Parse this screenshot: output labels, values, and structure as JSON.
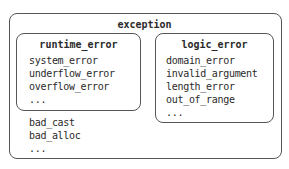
{
  "diagram": {
    "root": {
      "label": "exception",
      "children": [
        {
          "label": "runtime_error",
          "items": [
            "system_error",
            "underflow_error",
            "overflow_error",
            "..."
          ]
        },
        {
          "label": "logic_error",
          "items": [
            "domain_error",
            "invalid_argument",
            "length_error",
            "out_of_range",
            "..."
          ]
        }
      ],
      "items": [
        "bad_cast",
        "bad_alloc",
        "..."
      ]
    }
  }
}
